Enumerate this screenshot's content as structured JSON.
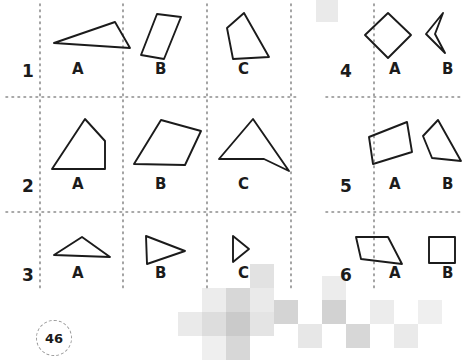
{
  "page": {
    "number": "46",
    "background_color": "#ffffff",
    "ink_color": "#1b1b1b",
    "gridline_color": "#8c8c8c",
    "watermark_color": "#c9c9c9"
  },
  "grid": {
    "line_style": "dotted",
    "vertical_lines_x": [
      40,
      123,
      207,
      291,
      374
    ],
    "horizontal_lines_y": [
      97,
      212
    ],
    "block_left_columns": [
      "A",
      "B",
      "C"
    ],
    "block_right_columns": [
      "A",
      "B"
    ]
  },
  "rows": [
    {
      "number": "1",
      "number_x": 22,
      "number_y": 63,
      "cells": [
        {
          "label": "A",
          "label_x": 72,
          "label_y": 62,
          "shape_name": "obtuse-scalene-triangle",
          "points": "7,35 68,14 83,40",
          "origin_x": 47,
          "origin_y": 8
        },
        {
          "label": "B",
          "label_x": 155,
          "label_y": 62,
          "shape_name": "slanted-narrow-parallelogram",
          "points": "20,6 44,9 27,51 4,47",
          "origin_x": 137,
          "origin_y": 8
        },
        {
          "label": "C",
          "label_x": 238,
          "label_y": 62,
          "shape_name": "irregular-quadrilateral",
          "points": "22,5 47,49 11,51 5,20",
          "origin_x": 222,
          "origin_y": 8
        }
      ]
    },
    {
      "number": "4",
      "number_x": 340,
      "number_y": 63,
      "cells": [
        {
          "label": "A",
          "label_x": 389,
          "label_y": 62,
          "shape_name": "diamond-rhombus",
          "points": "25,5 48,27 25,50 2,27",
          "origin_x": 363,
          "origin_y": 8
        },
        {
          "label": "B",
          "label_x": 442,
          "label_y": 62,
          "shape_name": "concave-dart-arrowhead",
          "points": "27,5 10,26 29,45 19,26",
          "origin_x": 416,
          "origin_y": 8
        }
      ]
    },
    {
      "number": "2",
      "number_x": 22,
      "number_y": 178,
      "cells": [
        {
          "label": "A",
          "label_x": 72,
          "label_y": 177,
          "shape_name": "right-trapezoid-with-apex",
          "points": "38,5 58,27 58,55 5,55",
          "origin_x": 47,
          "origin_y": 114
        },
        {
          "label": "B",
          "label_x": 155,
          "label_y": 177,
          "shape_name": "slanted-parallelogram",
          "points": "32,6 72,17 56,51 5,50",
          "origin_x": 129,
          "origin_y": 114
        },
        {
          "label": "C",
          "label_x": 238,
          "label_y": 177,
          "shape_name": "concave-quadrilateral-arrow",
          "points": "37,5 73,57 48,45 3,45",
          "origin_x": 216,
          "origin_y": 114
        }
      ]
    },
    {
      "number": "5",
      "number_x": 340,
      "number_y": 178,
      "cells": [
        {
          "label": "A",
          "label_x": 389,
          "label_y": 177,
          "shape_name": "parallelogram",
          "points": "42,8 47,38 8,50 4,23",
          "origin_x": 365,
          "origin_y": 114
        },
        {
          "label": "B",
          "label_x": 442,
          "label_y": 177,
          "shape_name": "irregular-quadrilateral",
          "points": "18,6 41,47 12,44 3,22",
          "origin_x": 420,
          "origin_y": 114
        }
      ]
    },
    {
      "number": "3",
      "number_x": 22,
      "number_y": 267,
      "cells": [
        {
          "label": "A",
          "label_x": 72,
          "label_y": 266,
          "shape_name": "flat-scalene-triangle",
          "points": "31,5 59,25 3,23",
          "origin_x": 51,
          "origin_y": 232
        },
        {
          "label": "B",
          "label_x": 155,
          "label_y": 266,
          "shape_name": "right-pointing-triangle",
          "points": "5,4 44,19 6,32",
          "origin_x": 141,
          "origin_y": 232
        },
        {
          "label": "C",
          "label_x": 238,
          "label_y": 266,
          "shape_name": "small-right-pointing-triangle",
          "points": "4,4 20,17 4,30",
          "origin_x": 229,
          "origin_y": 232
        }
      ]
    },
    {
      "number": "6",
      "number_x": 340,
      "number_y": 267,
      "cells": [
        {
          "label": "A",
          "label_x": 389,
          "label_y": 266,
          "shape_name": "trapezoid",
          "points": "4,5 36,5 50,32 9,27",
          "origin_x": 352,
          "origin_y": 232
        },
        {
          "label": "B",
          "label_x": 442,
          "label_y": 266,
          "shape_name": "square",
          "points": "4,5 30,5 30,31 4,31",
          "origin_x": 425,
          "origin_y": 232
        }
      ]
    }
  ],
  "watermark": {
    "name": "checkerboard-pattern",
    "squares": [
      {
        "x": 316,
        "y": 0,
        "size": 22,
        "opacity": 0.16
      },
      {
        "x": 250,
        "y": 264,
        "size": 24,
        "opacity": 0.22
      },
      {
        "x": 226,
        "y": 288,
        "size": 24,
        "opacity": 0.3
      },
      {
        "x": 202,
        "y": 288,
        "size": 24,
        "opacity": 0.14
      },
      {
        "x": 250,
        "y": 288,
        "size": 24,
        "opacity": 0.16
      },
      {
        "x": 202,
        "y": 312,
        "size": 24,
        "opacity": 0.26
      },
      {
        "x": 226,
        "y": 312,
        "size": 24,
        "opacity": 0.4
      },
      {
        "x": 250,
        "y": 312,
        "size": 24,
        "opacity": 0.2
      },
      {
        "x": 178,
        "y": 312,
        "size": 24,
        "opacity": 0.16
      },
      {
        "x": 226,
        "y": 336,
        "size": 24,
        "opacity": 0.3
      },
      {
        "x": 202,
        "y": 336,
        "size": 24,
        "opacity": 0.12
      },
      {
        "x": 274,
        "y": 300,
        "size": 24,
        "opacity": 0.32
      },
      {
        "x": 298,
        "y": 324,
        "size": 24,
        "opacity": 0.18
      },
      {
        "x": 322,
        "y": 276,
        "size": 24,
        "opacity": 0.14
      },
      {
        "x": 322,
        "y": 300,
        "size": 24,
        "opacity": 0.34
      },
      {
        "x": 346,
        "y": 324,
        "size": 24,
        "opacity": 0.3
      },
      {
        "x": 370,
        "y": 300,
        "size": 24,
        "opacity": 0.14
      },
      {
        "x": 394,
        "y": 324,
        "size": 24,
        "opacity": 0.16
      },
      {
        "x": 418,
        "y": 300,
        "size": 24,
        "opacity": 0.12
      }
    ]
  }
}
